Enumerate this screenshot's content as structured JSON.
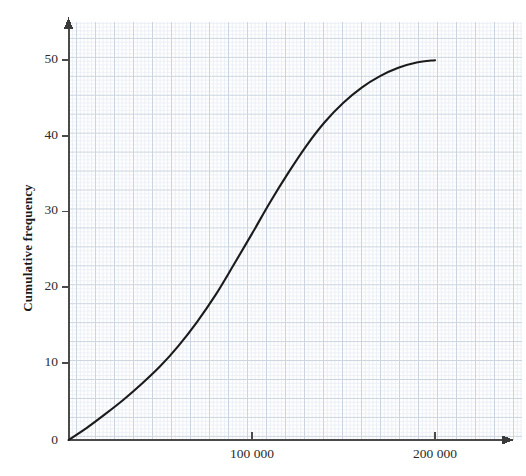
{
  "chart": {
    "axis_y_title": "Cumulative frequency",
    "axis_x_title": "",
    "origin_label": "0",
    "y_ticks": [
      "10",
      "20",
      "30",
      "40",
      "50"
    ],
    "x_ticks": [
      "100 000",
      "200 000"
    ],
    "curve_color": "#1b1b1b",
    "axis_color": "#4a4a4a",
    "grid_major_color": "#c9d2dc",
    "grid_minor_color": "#e6ecf2"
  },
  "chart_data": {
    "type": "line",
    "title": "",
    "subtitle": "",
    "xlabel": "",
    "ylabel": "Cumulative frequency",
    "xlim": [
      0,
      220000
    ],
    "ylim": [
      0,
      53
    ],
    "xticks": [
      100000,
      200000
    ],
    "xticklabels": [
      "100 000",
      "200 000"
    ],
    "yticks": [
      0,
      10,
      20,
      30,
      40,
      50
    ],
    "yticklabels": [
      "0",
      "10",
      "20",
      "30",
      "40",
      "50"
    ],
    "grid": true,
    "legend": "none",
    "series": [
      {
        "name": "Cumulative frequency",
        "x": [
          0,
          10000,
          20000,
          30000,
          40000,
          50000,
          60000,
          70000,
          80000,
          90000,
          100000,
          110000,
          120000,
          130000,
          140000,
          150000,
          160000,
          170000,
          180000,
          190000,
          200000
        ],
        "y": [
          0,
          1.6,
          3.4,
          5.3,
          7.4,
          9.7,
          12.4,
          15.5,
          19.0,
          23.0,
          27.1,
          31.3,
          35.2,
          38.8,
          41.9,
          44.4,
          46.4,
          47.9,
          49.0,
          49.7,
          50.0
        ]
      }
    ]
  }
}
